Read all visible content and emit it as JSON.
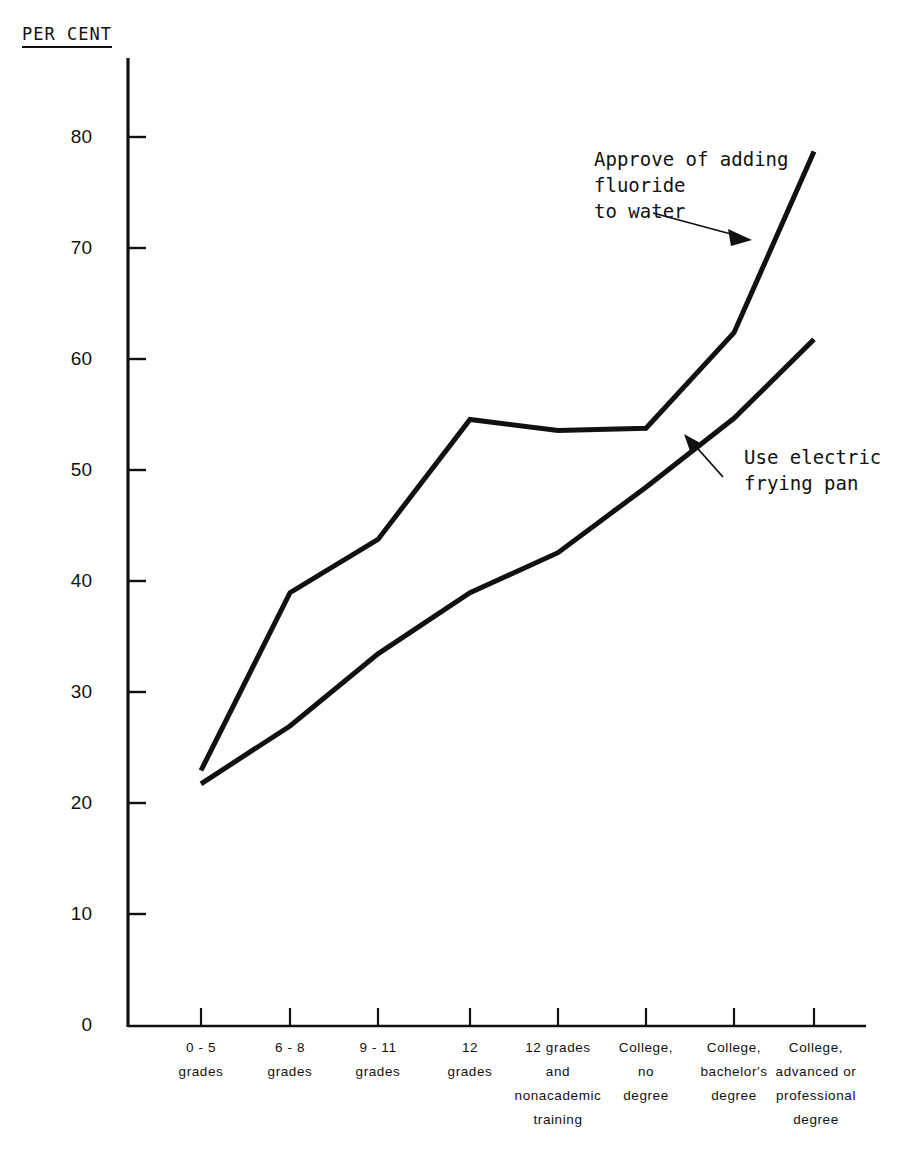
{
  "chart_data": {
    "type": "line",
    "title": "",
    "ylabel": "PER CENT",
    "xlabel": "",
    "ylim": [
      0,
      85
    ],
    "yticks": [
      0,
      10,
      20,
      30,
      40,
      50,
      60,
      70,
      80
    ],
    "ytick_labels": [
      "0",
      "10",
      "20",
      "30",
      "40",
      "50",
      "60",
      "70",
      "80"
    ],
    "grid": false,
    "legend_position": "inline-annotations",
    "categories": [
      "0 - 5\ngrades",
      "6 - 8\ngrades",
      "9 - 11\ngrades",
      "12\ngrades",
      "12 grades\nand\nnonacademic\ntraining",
      "College,\nno\ndegree",
      "College,\nbachelor's\ndegree",
      "College,\nadvanced or\nprofessional\ndegree"
    ],
    "category_lines": [
      [
        "0 - 5",
        "grades"
      ],
      [
        "6 - 8",
        "grades"
      ],
      [
        "9 - 11",
        "grades"
      ],
      [
        "12",
        "grades"
      ],
      [
        "12 grades",
        "and",
        "nonacademic",
        "training"
      ],
      [
        "College,",
        "no",
        "degree"
      ],
      [
        "College,",
        "bachelor's",
        "degree"
      ],
      [
        "College,",
        "advanced or",
        "professional",
        "degree"
      ]
    ],
    "series": [
      {
        "name": "Approve of adding fluoride to water",
        "values": [
          23.0,
          39.0,
          43.8,
          54.6,
          53.6,
          53.8,
          62.4,
          78.7
        ]
      },
      {
        "name": "Use electric frying pan",
        "values": [
          21.8,
          27.0,
          33.5,
          39.0,
          42.6,
          48.5,
          54.7,
          61.8
        ]
      }
    ],
    "annotations": [
      {
        "id": "fluoride",
        "lines": [
          "Approve of adding",
          "fluoride",
          "to water"
        ],
        "target_series": "Approve of adding fluoride to water"
      },
      {
        "id": "frying-pan",
        "lines": [
          "Use electric",
          "frying pan"
        ],
        "target_series": "Use electric frying pan"
      }
    ],
    "line_color": "#111111",
    "axis_color": "#111111"
  }
}
